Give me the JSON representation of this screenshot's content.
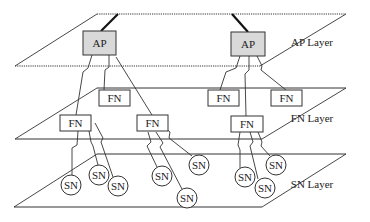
{
  "colors": {
    "line": "#333333",
    "ap_fill": "#d9d9d9",
    "box_fill": "#ffffff",
    "background": "#ffffff"
  },
  "layers": [
    {
      "id": "ap",
      "label": "AP Layer",
      "dotted": true,
      "plane": [
        [
          97,
          14
        ],
        [
          346,
          14
        ],
        [
          260,
          66
        ],
        [
          15,
          66
        ]
      ],
      "label_pos": [
        312,
        46
      ]
    },
    {
      "id": "fn",
      "label": "FN Layer",
      "dotted": false,
      "plane": [
        [
          97,
          88
        ],
        [
          346,
          88
        ],
        [
          262,
          139
        ],
        [
          15,
          139
        ]
      ],
      "label_pos": [
        312,
        122
      ]
    },
    {
      "id": "sn",
      "label": "SN Layer",
      "dotted": false,
      "plane": [
        [
          97,
          154
        ],
        [
          346,
          154
        ],
        [
          262,
          207
        ],
        [
          14,
          207
        ]
      ],
      "label_pos": [
        312,
        188
      ]
    }
  ],
  "uplinks": [
    {
      "from": [
        118,
        14
      ],
      "to": [
        101,
        31
      ]
    },
    {
      "from": [
        232,
        14
      ],
      "to": [
        248,
        32
      ]
    }
  ],
  "ap_nodes": [
    {
      "label": "AP",
      "x": 83,
      "y": 31,
      "w": 33,
      "h": 24
    },
    {
      "label": "AP",
      "x": 231,
      "y": 32,
      "w": 34,
      "h": 24
    }
  ],
  "fn_nodes": [
    {
      "label": "FN",
      "x": 99,
      "y": 90,
      "w": 31,
      "h": 16
    },
    {
      "label": "FN",
      "x": 60,
      "y": 115,
      "w": 31,
      "h": 16
    },
    {
      "label": "FN",
      "x": 137,
      "y": 115,
      "w": 31,
      "h": 16
    },
    {
      "label": "FN",
      "x": 208,
      "y": 90,
      "w": 31,
      "h": 16
    },
    {
      "label": "FN",
      "x": 271,
      "y": 90,
      "w": 31,
      "h": 16
    },
    {
      "label": "FN",
      "x": 231,
      "y": 116,
      "w": 32,
      "h": 16
    }
  ],
  "sn_nodes": [
    {
      "label": "SN",
      "cx": 71,
      "cy": 185,
      "r": 10
    },
    {
      "label": "SN",
      "cx": 99,
      "cy": 175,
      "r": 10
    },
    {
      "label": "SN",
      "cx": 118,
      "cy": 186,
      "r": 10
    },
    {
      "label": "SN",
      "cx": 162,
      "cy": 176,
      "r": 10
    },
    {
      "label": "SN",
      "cx": 199,
      "cy": 165,
      "r": 10
    },
    {
      "label": "SN",
      "cx": 187,
      "cy": 198,
      "r": 10
    },
    {
      "label": "SN",
      "cx": 245,
      "cy": 177,
      "r": 10
    },
    {
      "label": "SN",
      "cx": 265,
      "cy": 188,
      "r": 10
    },
    {
      "label": "SN",
      "cx": 276,
      "cy": 165,
      "r": 10
    }
  ],
  "links": [
    {
      "points": [
        [
          92,
          55
        ],
        [
          88,
          68
        ],
        [
          83,
          72
        ],
        [
          76,
          115
        ]
      ]
    },
    {
      "points": [
        [
          109,
          55
        ],
        [
          109,
          67
        ],
        [
          105,
          70
        ],
        [
          104,
          90
        ]
      ]
    },
    {
      "points": [
        [
          116,
          57
        ],
        [
          152,
          115
        ]
      ]
    },
    {
      "points": [
        [
          240,
          56
        ],
        [
          236,
          68
        ],
        [
          226,
          72
        ],
        [
          220,
          90
        ]
      ]
    },
    {
      "points": [
        [
          249,
          56
        ],
        [
          249,
          70
        ],
        [
          245,
          74
        ],
        [
          246,
          116
        ]
      ]
    },
    {
      "points": [
        [
          257,
          56
        ],
        [
          262,
          66
        ],
        [
          261,
          70
        ],
        [
          286,
          90
        ]
      ]
    },
    {
      "points": [
        [
          78,
          131
        ],
        [
          77,
          145
        ],
        [
          72,
          148
        ],
        [
          72,
          175
        ]
      ]
    },
    {
      "points": [
        [
          89,
          131
        ],
        [
          91,
          142
        ],
        [
          93,
          146
        ],
        [
          98,
          165
        ]
      ]
    },
    {
      "points": [
        [
          95,
          123
        ],
        [
          103,
          138
        ],
        [
          101,
          142
        ],
        [
          113,
          177
        ]
      ]
    },
    {
      "points": [
        [
          148,
          132
        ],
        [
          151,
          142
        ],
        [
          147,
          146
        ],
        [
          157,
          167
        ]
      ]
    },
    {
      "points": [
        [
          156,
          132
        ],
        [
          163,
          143
        ],
        [
          160,
          147
        ],
        [
          182,
          189
        ]
      ]
    },
    {
      "points": [
        [
          162,
          125
        ],
        [
          170,
          132
        ],
        [
          169,
          138
        ],
        [
          192,
          156
        ]
      ]
    },
    {
      "points": [
        [
          240,
          132
        ],
        [
          238,
          145
        ],
        [
          240,
          150
        ],
        [
          240,
          168
        ]
      ]
    },
    {
      "points": [
        [
          250,
          132
        ],
        [
          253,
          142
        ],
        [
          250,
          146
        ],
        [
          258,
          179
        ]
      ]
    },
    {
      "points": [
        [
          258,
          132
        ],
        [
          262,
          142
        ],
        [
          261,
          146
        ],
        [
          270,
          156
        ]
      ]
    }
  ]
}
